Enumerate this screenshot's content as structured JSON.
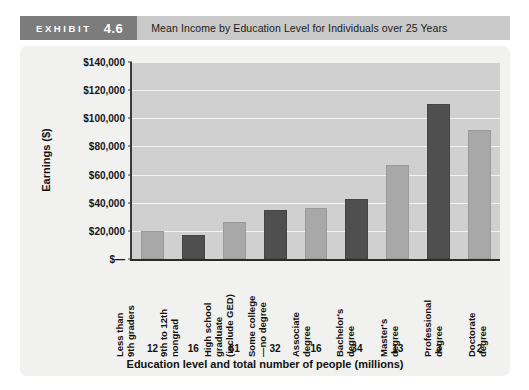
{
  "header": {
    "exhibit_word": "EXHIBIT",
    "exhibit_number": "4.6",
    "title": "Mean Income by Education Level for Individuals over 25 Years"
  },
  "chart_data": {
    "type": "bar",
    "title": "Mean Income by Education Level for Individuals over 25 Years",
    "xlabel": "Education level and total number of people (millions)",
    "ylabel": "Earnings ($)",
    "ylim": [
      0,
      140000
    ],
    "ytick_step": 20000,
    "grid": true,
    "legend": "none",
    "ytick_labels": [
      "$140,000",
      "$120,000",
      "$100,000",
      "$80,000",
      "$60,000",
      "$40,000",
      "$20,000",
      "$—"
    ],
    "ytick_values": [
      140000,
      120000,
      100000,
      80000,
      60000,
      40000,
      20000,
      0
    ],
    "categories": [
      "Less than\n9th graders",
      "9th to 12th\nnongrad",
      "High school\ngraduate\n(include GED)",
      "Some college\n—no degree",
      "Associate\ndegree",
      "Bachelor's\ndegree",
      "Master's\ndegree",
      "Professional\ndegree",
      "Doctorate\ndegree"
    ],
    "categories_flat": [
      "Less than 9th graders",
      "9th to 12th nongrad",
      "High school graduate (include GED)",
      "Some college —no degree",
      "Associate degree",
      "Bachelor's degree",
      "Master's degree",
      "Professional degree",
      "Doctorate degree"
    ],
    "values": [
      20000,
      17000,
      26000,
      35000,
      36000,
      43000,
      67000,
      110000,
      92000
    ],
    "counts_millions": [
      "12",
      "16",
      "61",
      "32",
      "16",
      "34",
      "13",
      "3",
      "2"
    ],
    "bar_colors": [
      "#a8a8a8",
      "#4f4f4f",
      "#a8a8a8",
      "#4f4f4f",
      "#a8a8a8",
      "#4f4f4f",
      "#a8a8a8",
      "#4f4f4f",
      "#a8a8a8"
    ],
    "plot_background": "#d0d0d0",
    "card_background": "#f1f1ef",
    "accent": "#7c7c7c"
  }
}
